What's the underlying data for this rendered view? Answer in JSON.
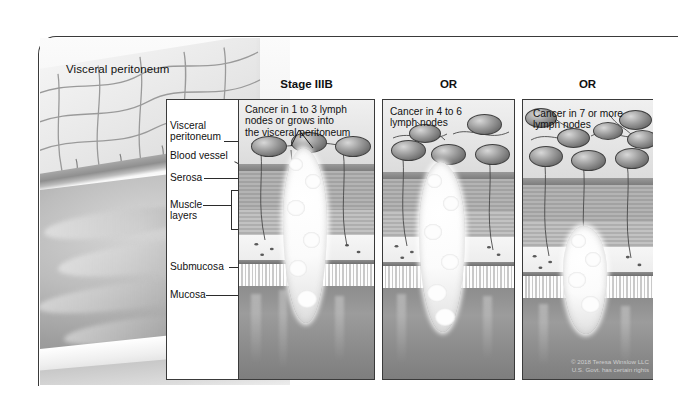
{
  "illustration": {
    "top_label": "Visceral peritoneum",
    "copyright": "© 2018 Teresa Winslow LLC\nU.S. Govt. has certain rights"
  },
  "legend": {
    "items": [
      {
        "label": "Visceral\nperitoneum",
        "name": "visceral-peritoneum"
      },
      {
        "label": "Blood vessel",
        "name": "blood-vessel"
      },
      {
        "label": "Serosa",
        "name": "serosa"
      },
      {
        "label": "Muscle\nlayers",
        "name": "muscle-layers"
      },
      {
        "label": "Submucosa",
        "name": "submucosa"
      },
      {
        "label": "Mucosa",
        "name": "mucosa"
      }
    ]
  },
  "panels": [
    {
      "header": "Stage IIIB",
      "caption": "Cancer in 1 to 3 lymph\nnodes or grows into\nthe visceral peritoneum",
      "node_count": 3
    },
    {
      "header": "OR",
      "caption": "Cancer in 4 to 6\nlymph nodes",
      "node_count": 5
    },
    {
      "header": "OR",
      "caption": "Cancer in 7 or more\nlymph nodes",
      "node_count": 8
    }
  ],
  "colors": {
    "ink": "#111111",
    "frame": "#3a3a3a",
    "node_dark": "#4e4e4e",
    "tumor_light": "#ffffff"
  }
}
